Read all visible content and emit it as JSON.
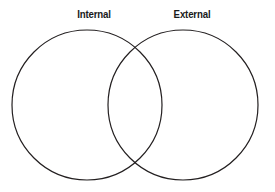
{
  "figure": {
    "type": "venn-diagram",
    "background_color": "#ffffff",
    "stroke_color": "#231f20",
    "stroke_width": 1.2,
    "label_color": "#1a1a1a"
  },
  "labels": {
    "left": "Internal",
    "right": "External"
  },
  "chart_data": {
    "type": "venn",
    "title": "",
    "sets": [
      {
        "name": "Internal",
        "label": "Internal",
        "cx": 87,
        "cy": 105,
        "r": 75,
        "fill": "none",
        "stroke": "#231f20"
      },
      {
        "name": "External",
        "label": "External",
        "cx": 183,
        "cy": 105,
        "r": 75,
        "fill": "none",
        "stroke": "#231f20"
      }
    ],
    "intersection": {
      "label": "",
      "upper_crossing": [
        135,
        50
      ],
      "lower_crossing": [
        135,
        162
      ]
    },
    "legend": "none",
    "grid": false
  }
}
